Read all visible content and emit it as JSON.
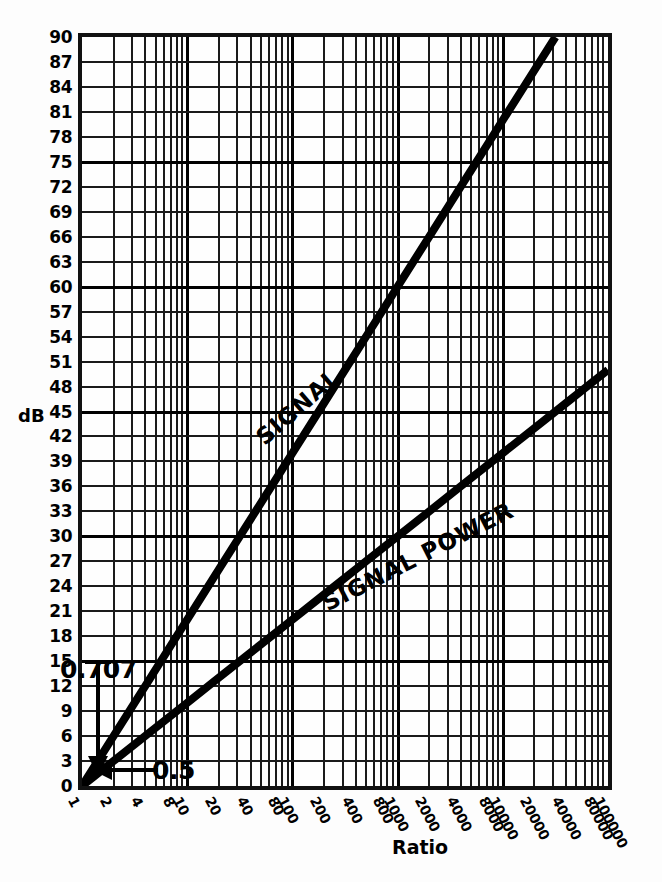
{
  "chart_data": {
    "type": "line",
    "title": "",
    "xlabel": "Ratio",
    "ylabel": "dB",
    "xscale": "log",
    "xlim": [
      1,
      100000
    ],
    "ylim": [
      0,
      90
    ],
    "grid": true,
    "legend": "inline-labels",
    "xticklabels": [
      "1",
      "2",
      "4",
      "8",
      "10",
      "20",
      "40",
      "80",
      "100",
      "200",
      "400",
      "800",
      "1000",
      "2000",
      "4000",
      "8000",
      "10000",
      "20000",
      "40000",
      "80000",
      "100000"
    ],
    "xtickvalues": [
      1,
      2,
      4,
      8,
      10,
      20,
      40,
      80,
      100,
      200,
      400,
      800,
      1000,
      2000,
      4000,
      8000,
      10000,
      20000,
      40000,
      80000,
      100000
    ],
    "yticklabels": [
      "0",
      "3",
      "6",
      "9",
      "12",
      "15",
      "18",
      "21",
      "24",
      "27",
      "30",
      "33",
      "36",
      "39",
      "42",
      "45",
      "48",
      "51",
      "54",
      "57",
      "60",
      "63",
      "66",
      "69",
      "72",
      "75",
      "78",
      "81",
      "84",
      "87",
      "90"
    ],
    "ytickvalues": [
      0,
      3,
      6,
      9,
      12,
      15,
      18,
      21,
      24,
      27,
      30,
      33,
      36,
      39,
      42,
      45,
      48,
      51,
      54,
      57,
      60,
      63,
      66,
      69,
      72,
      75,
      78,
      81,
      84,
      87,
      90
    ],
    "series": [
      {
        "name": "SIGNAL",
        "formula": "20*log10(ratio)",
        "points": [
          {
            "x": 1,
            "y": 0
          },
          {
            "x": 2,
            "y": 6.02
          },
          {
            "x": 4,
            "y": 12.04
          },
          {
            "x": 8,
            "y": 18.06
          },
          {
            "x": 10,
            "y": 20
          },
          {
            "x": 20,
            "y": 26.02
          },
          {
            "x": 40,
            "y": 32.04
          },
          {
            "x": 80,
            "y": 38.06
          },
          {
            "x": 100,
            "y": 40
          },
          {
            "x": 200,
            "y": 46.02
          },
          {
            "x": 400,
            "y": 52.04
          },
          {
            "x": 800,
            "y": 58.06
          },
          {
            "x": 1000,
            "y": 60
          },
          {
            "x": 2000,
            "y": 66.02
          },
          {
            "x": 4000,
            "y": 72.04
          },
          {
            "x": 8000,
            "y": 78.06
          },
          {
            "x": 10000,
            "y": 80
          },
          {
            "x": 20000,
            "y": 86.02
          },
          {
            "x": 31623,
            "y": 90
          }
        ]
      },
      {
        "name": "SIGNAL POWER",
        "formula": "10*log10(ratio)",
        "points": [
          {
            "x": 1,
            "y": 0
          },
          {
            "x": 2,
            "y": 3.01
          },
          {
            "x": 4,
            "y": 6.02
          },
          {
            "x": 8,
            "y": 9.03
          },
          {
            "x": 10,
            "y": 10
          },
          {
            "x": 20,
            "y": 13.01
          },
          {
            "x": 40,
            "y": 16.02
          },
          {
            "x": 80,
            "y": 19.03
          },
          {
            "x": 100,
            "y": 20
          },
          {
            "x": 200,
            "y": 23.01
          },
          {
            "x": 400,
            "y": 26.02
          },
          {
            "x": 800,
            "y": 29.03
          },
          {
            "x": 1000,
            "y": 30
          },
          {
            "x": 2000,
            "y": 33.01
          },
          {
            "x": 4000,
            "y": 36.02
          },
          {
            "x": 8000,
            "y": 39.03
          },
          {
            "x": 10000,
            "y": 40
          },
          {
            "x": 20000,
            "y": 43.01
          },
          {
            "x": 40000,
            "y": 46.02
          },
          {
            "x": 80000,
            "y": 49.03
          },
          {
            "x": 100000,
            "y": 50
          }
        ]
      }
    ],
    "annotations": [
      {
        "label": "0.707",
        "x": 1.0,
        "y": 15,
        "note": "arrow pointing down to SIGNAL curve near origin"
      },
      {
        "label": "0.5",
        "x": 1.1,
        "y": 3,
        "note": "arrow pointing left to SIGNAL POWER curve near origin"
      }
    ]
  },
  "axis": {
    "y_title": "dB",
    "x_title": "Ratio"
  },
  "curve_labels": {
    "signal": "SIGNAL",
    "signal_power": "SIGNAL POWER"
  },
  "annotations": {
    "a0707": "0.707",
    "a05": "0.5"
  },
  "colors": {
    "ink": "#000000",
    "grid": "#1a1a1a",
    "background": "#ffffff"
  }
}
